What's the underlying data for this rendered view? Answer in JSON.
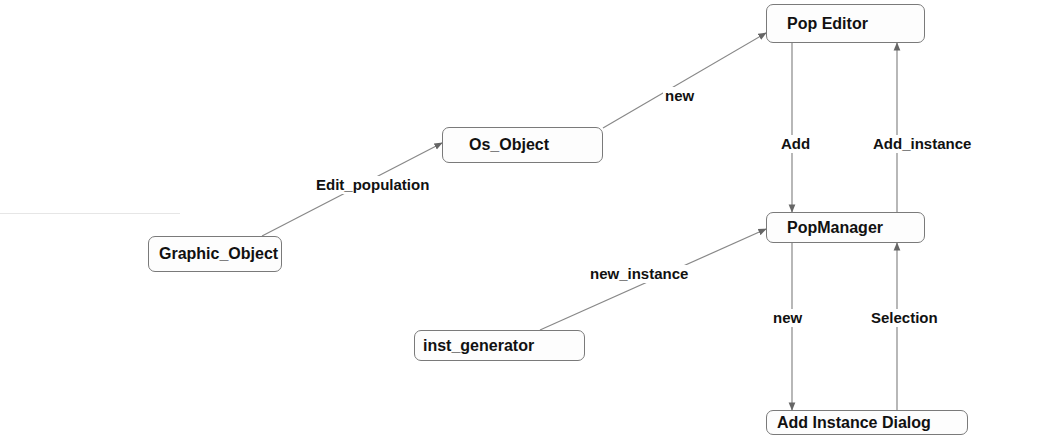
{
  "diagram": {
    "type": "object-collaboration-diagram",
    "colors": {
      "background": "#ffffff",
      "node_border": "#7a7a7a",
      "edge": "#777777",
      "text": "#111111"
    },
    "nodes": [
      {
        "id": "graphic_object",
        "label": "Graphic_Object"
      },
      {
        "id": "os_object",
        "label": "Os_Object"
      },
      {
        "id": "pop_editor",
        "label": "Pop Editor"
      },
      {
        "id": "pop_manager",
        "label": "PopManager"
      },
      {
        "id": "inst_generator",
        "label": "inst_generator"
      },
      {
        "id": "add_instance_dialog",
        "label": "Add Instance Dialog"
      }
    ],
    "edges": [
      {
        "from": "graphic_object",
        "to": "os_object",
        "label": "Edit_population"
      },
      {
        "from": "os_object",
        "to": "pop_editor",
        "label": "new"
      },
      {
        "from": "pop_editor",
        "to": "pop_manager",
        "label": "Add"
      },
      {
        "from": "pop_manager",
        "to": "pop_editor",
        "label": "Add_instance"
      },
      {
        "from": "inst_generator",
        "to": "pop_manager",
        "label": "new_instance"
      },
      {
        "from": "pop_manager",
        "to": "add_instance_dialog",
        "label": "new"
      },
      {
        "from": "add_instance_dialog",
        "to": "pop_manager",
        "label": "Selection"
      }
    ]
  }
}
